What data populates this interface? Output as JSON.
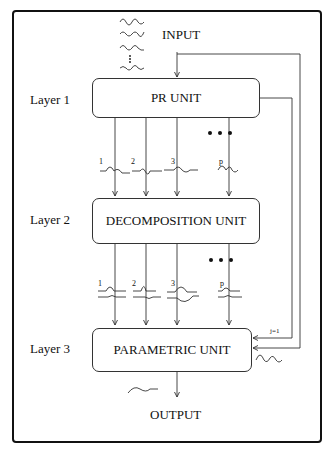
{
  "diagram": {
    "input_label": "INPUT",
    "output_label": "OUTPUT",
    "layers": [
      {
        "label": "Layer 1",
        "unit": "PR UNIT"
      },
      {
        "label": "Layer 2",
        "unit": "DECOMPOSITION UNIT"
      },
      {
        "label": "Layer 3",
        "unit": "PARAMETRIC UNIT"
      }
    ],
    "channels_layer1": [
      "1",
      "2",
      "3",
      "p"
    ],
    "channels_layer2": [
      "1",
      "2",
      "3",
      "p"
    ],
    "ellipsis": "• • •",
    "feedback_label": "j=1"
  }
}
